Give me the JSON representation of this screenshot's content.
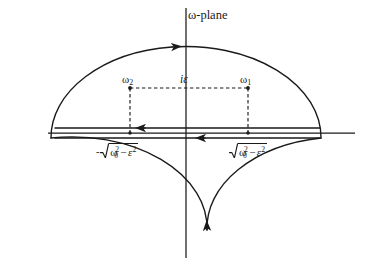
{
  "figure": {
    "title": "ω-plane",
    "domain_kind": "complex-plane-contour",
    "background_color": "#ffffff",
    "line_color": "#1a1a1a",
    "width": 373,
    "height": 265
  },
  "axes": {
    "imaginary_axis": {
      "name": "imaginary-axis",
      "x": 186,
      "y_top": 8,
      "y_bottom": 258
    },
    "real_axis": {
      "name": "real-axis",
      "y": 133,
      "x_left": 48,
      "x_right": 355
    }
  },
  "contour": {
    "name": "closed-contour",
    "ellipse": {
      "cx": 186,
      "cy": 138,
      "rx": 135,
      "ry": 91
    },
    "segments": [
      {
        "name": "upper-real-segment",
        "y": 128,
        "x_start": 55,
        "x_end": 320,
        "direction": "right"
      },
      {
        "name": "lower-real-segment",
        "y": 138,
        "x_start": 55,
        "x_end": 320,
        "direction": "right"
      }
    ],
    "arrows": [
      {
        "name": "arrow-upper-arc",
        "x": 172,
        "y": 47,
        "direction": "left"
      },
      {
        "name": "arrow-lower-arc",
        "x": 207,
        "y": 230,
        "direction": "left"
      },
      {
        "name": "arrow-upper-segment",
        "x": 145,
        "y": 128,
        "direction": "right"
      },
      {
        "name": "arrow-lower-segment",
        "x": 205,
        "y": 138,
        "direction": "right"
      }
    ]
  },
  "poles": {
    "dashed_guide": {
      "name": "dashed-guide-rectangle",
      "top_y": 88,
      "left_x": 130,
      "right_x": 248,
      "bottom_y": 133
    },
    "points": [
      {
        "name": "pole-omega-2",
        "x": 130,
        "y": 88,
        "label": "ω₂"
      },
      {
        "name": "pole-omega-1",
        "x": 248,
        "y": 88,
        "label": "ω₁"
      },
      {
        "name": "root-point-negative",
        "x": 130,
        "y": 133,
        "label": "-√(ω₀²−ε²)"
      },
      {
        "name": "root-point-positive",
        "x": 248,
        "y": 133,
        "label": "√(ω₀²−ε²)"
      }
    ]
  },
  "labels": {
    "plane": "ω-plane",
    "omega2": {
      "base": "ω",
      "sub": "2"
    },
    "i_epsilon": "iε",
    "omega1": {
      "base": "ω",
      "sub": "1"
    },
    "sqrt_negative": {
      "sign": "-",
      "omega_base": "ω",
      "omega_sup": "2",
      "omega_sub": "0",
      "operator": "−",
      "epsilon": "ε",
      "epsilon_sup": "2",
      "plain": "-√(ω₀² − ε²)"
    },
    "sqrt_positive": {
      "sign": "",
      "omega_base": "ω",
      "omega_sup": "2",
      "omega_sub": "0",
      "operator": "−",
      "epsilon": "ε",
      "epsilon_sup": "2",
      "plain": "√(ω₀² − ε²)"
    }
  }
}
